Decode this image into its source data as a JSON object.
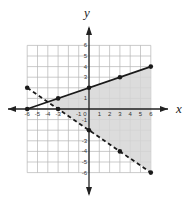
{
  "chart_data": {
    "type": "line",
    "title": "",
    "xlabel": "x",
    "ylabel": "y",
    "xlim": [
      -6,
      6
    ],
    "ylim": [
      -6,
      6
    ],
    "grid": true,
    "x_ticks": [
      -6,
      -5,
      -4,
      -3,
      -1,
      0,
      1,
      2,
      3,
      4,
      5,
      6
    ],
    "y_ticks": [
      6,
      5,
      4,
      3,
      1,
      0,
      -1,
      -3,
      -4,
      -5,
      -6
    ],
    "x_tick_labels": [
      "-6",
      "-5",
      "-4",
      "-3",
      "-1",
      "0",
      "1",
      "2",
      "3",
      "4",
      "5",
      "6"
    ],
    "y_tick_labels": [
      "6",
      "5",
      "4",
      "3",
      "1",
      "0",
      "-1",
      "-3",
      "-4",
      "-5",
      "-6"
    ],
    "series": [
      {
        "name": "solid boundary",
        "style": "solid",
        "equation": "y = (1/3)x + 2",
        "points": [
          [
            -6,
            0
          ],
          [
            -3,
            1
          ],
          [
            0,
            2
          ],
          [
            3,
            3
          ],
          [
            6,
            4
          ]
        ]
      },
      {
        "name": "dashed boundary",
        "style": "dashed",
        "equation": "y = -(2/3)x - 2",
        "points": [
          [
            -6,
            2
          ],
          [
            -3,
            0
          ],
          [
            0,
            -2
          ],
          [
            3,
            -4
          ],
          [
            6,
            -6
          ]
        ]
      }
    ],
    "shaded_region": {
      "description": "below solid line, above dashed line, x <= 6",
      "vertices": [
        [
          -4,
          0.667
        ],
        [
          6,
          4
        ],
        [
          6,
          -6
        ]
      ],
      "color": "#d6d6d6"
    }
  },
  "labels": {
    "x_axis": "x",
    "y_axis": "y"
  },
  "colors": {
    "grid": "#b5b5b5",
    "axis": "#222222",
    "line": "#1a1a1a",
    "shade": "#d6d6d6"
  }
}
